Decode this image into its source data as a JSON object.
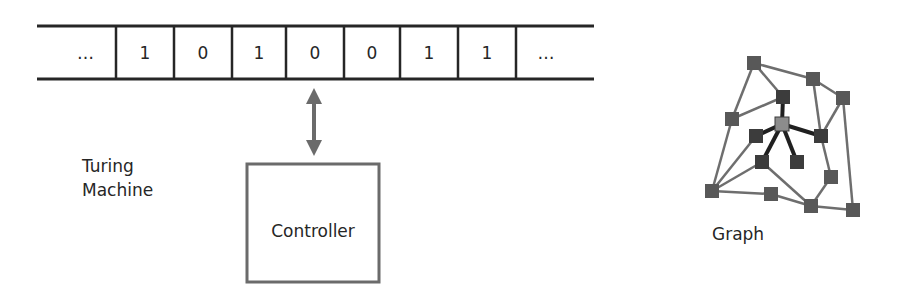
{
  "tape": {
    "cells": [
      "…",
      "1",
      "0",
      "1",
      "0",
      "0",
      "1",
      "1",
      "…"
    ],
    "dividers_x": [
      116,
      174,
      232,
      286,
      344,
      400,
      458,
      516
    ],
    "left_x": 37,
    "right_x": 594,
    "top_y": 26,
    "bottom_y": 79,
    "line_color": "#262626"
  },
  "machine_label": {
    "line1": "Turing",
    "line2": "Machine"
  },
  "controller": {
    "label": "Controller",
    "x": 247,
    "y": 164,
    "w": 132,
    "h": 118,
    "border_color": "#6b6b6b"
  },
  "arrow": {
    "x": 314,
    "y1": 89,
    "y2": 155,
    "color": "#6b6b6b",
    "type": "bidirectional"
  },
  "graph": {
    "label": "Graph",
    "colors": {
      "node": "#585858",
      "node_dark": "#3c3c3c",
      "node_center": "#8c8c8c",
      "edge": "#6e6e6e",
      "edge_strong": "#202020"
    },
    "nodes": [
      {
        "id": "A",
        "x": 754,
        "y": 63,
        "kind": "node"
      },
      {
        "id": "B",
        "x": 732,
        "y": 119,
        "kind": "node"
      },
      {
        "id": "C",
        "x": 783,
        "y": 97,
        "kind": "node_dark"
      },
      {
        "id": "D",
        "x": 813,
        "y": 79,
        "kind": "node"
      },
      {
        "id": "E",
        "x": 843,
        "y": 98,
        "kind": "node"
      },
      {
        "id": "X",
        "x": 782,
        "y": 124,
        "kind": "node_center"
      },
      {
        "id": "F",
        "x": 821,
        "y": 136,
        "kind": "node_dark"
      },
      {
        "id": "G",
        "x": 756,
        "y": 136,
        "kind": "node_dark"
      },
      {
        "id": "H",
        "x": 762,
        "y": 162,
        "kind": "node_dark"
      },
      {
        "id": "K",
        "x": 797,
        "y": 162,
        "kind": "node_dark"
      },
      {
        "id": "L",
        "x": 831,
        "y": 177,
        "kind": "node"
      },
      {
        "id": "I",
        "x": 712,
        "y": 191,
        "kind": "node"
      },
      {
        "id": "J",
        "x": 771,
        "y": 194,
        "kind": "node"
      },
      {
        "id": "M",
        "x": 811,
        "y": 206,
        "kind": "node"
      },
      {
        "id": "N",
        "x": 853,
        "y": 210,
        "kind": "node"
      }
    ],
    "edges": [
      {
        "from": "A",
        "to": "B",
        "strong": false
      },
      {
        "from": "A",
        "to": "C",
        "strong": false
      },
      {
        "from": "A",
        "to": "D",
        "strong": false
      },
      {
        "from": "B",
        "to": "C",
        "strong": false
      },
      {
        "from": "B",
        "to": "I",
        "strong": false
      },
      {
        "from": "D",
        "to": "E",
        "strong": false
      },
      {
        "from": "D",
        "to": "F",
        "strong": false
      },
      {
        "from": "E",
        "to": "F",
        "strong": false
      },
      {
        "from": "E",
        "to": "N",
        "strong": false
      },
      {
        "from": "F",
        "to": "L",
        "strong": false
      },
      {
        "from": "G",
        "to": "I",
        "strong": false
      },
      {
        "from": "H",
        "to": "I",
        "strong": false
      },
      {
        "from": "H",
        "to": "M",
        "strong": false
      },
      {
        "from": "I",
        "to": "J",
        "strong": false
      },
      {
        "from": "J",
        "to": "M",
        "strong": false
      },
      {
        "from": "L",
        "to": "M",
        "strong": false
      },
      {
        "from": "M",
        "to": "N",
        "strong": false
      },
      {
        "from": "X",
        "to": "C",
        "strong": true
      },
      {
        "from": "X",
        "to": "G",
        "strong": true
      },
      {
        "from": "X",
        "to": "F",
        "strong": true
      },
      {
        "from": "X",
        "to": "H",
        "strong": true
      },
      {
        "from": "X",
        "to": "K",
        "strong": true
      }
    ]
  }
}
